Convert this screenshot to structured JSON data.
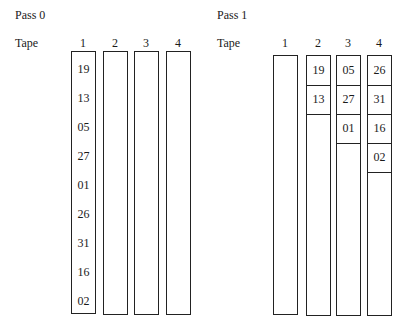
{
  "passes": [
    {
      "title": "Pass 0",
      "tape_label": "Tape",
      "tapes": [
        {
          "number": "1",
          "records": [
            "19",
            "13",
            "05",
            "27",
            "01",
            "26",
            "31",
            "16",
            "02"
          ]
        },
        {
          "number": "2",
          "records": []
        },
        {
          "number": "3",
          "records": []
        },
        {
          "number": "4",
          "records": []
        }
      ]
    },
    {
      "title": "Pass 1",
      "tape_label": "Tape",
      "tapes": [
        {
          "number": "1",
          "records": []
        },
        {
          "number": "2",
          "records": [
            "19",
            "13"
          ]
        },
        {
          "number": "3",
          "records": [
            "05",
            "27",
            "01"
          ]
        },
        {
          "number": "4",
          "records": [
            "26",
            "31",
            "16",
            "02"
          ]
        }
      ]
    }
  ]
}
